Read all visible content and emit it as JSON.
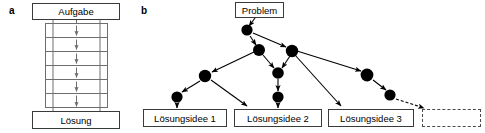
{
  "figure": {
    "width": 485,
    "height": 133,
    "background": "#ffffff",
    "line_color": "#000000",
    "box_border_color": "#3a3a3a",
    "rung_border_color": "#6e6e6e",
    "node_color": "#000000"
  },
  "panel_a": {
    "letter": "a",
    "top_box_label": "Aufgabe",
    "bottom_box_label": "Lösung",
    "rung_count": 6,
    "arrow_glyph": "↓"
  },
  "panel_b": {
    "letter": "b",
    "top_box_label": "Problem",
    "solution_boxes": [
      {
        "label": "Lösungsidee 1"
      },
      {
        "label": "Lösungsidee 2"
      },
      {
        "label": "Lösungsidee 3"
      },
      {
        "label": ""
      }
    ]
  }
}
